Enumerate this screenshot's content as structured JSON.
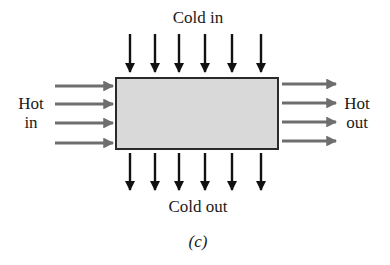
{
  "diagram": {
    "type": "crossflow_heat_exchanger",
    "labels": {
      "cold_in": "Cold in",
      "cold_out": "Cold out",
      "hot_in_line1": "Hot",
      "hot_in_line2": "in",
      "hot_out_line1": "Hot",
      "hot_out_line2": "out",
      "caption": "(c)"
    },
    "colors": {
      "box_fill": "#d9d9d9",
      "box_stroke": "#2a2a2a",
      "cold_arrow": "#111111",
      "hot_arrow": "#6e6e6e"
    },
    "box": {
      "x": 116,
      "y": 78,
      "width": 162,
      "height": 71
    },
    "cold_in_arrows": {
      "count": 6,
      "x": [
        130,
        155,
        179,
        205,
        232,
        261
      ],
      "y_start": 34,
      "y_end": 72
    },
    "cold_out_arrows": {
      "count": 6,
      "x": [
        130,
        155,
        179,
        205,
        232,
        261
      ],
      "y_start": 153,
      "y_end": 190
    },
    "hot_in_arrows": {
      "count": 4,
      "y": [
        86,
        104,
        123,
        143
      ],
      "x_start": 55,
      "x_end": 113
    },
    "hot_out_arrows": {
      "count": 4,
      "y": [
        84,
        103,
        122,
        141
      ],
      "x_start": 282,
      "x_end": 336
    }
  }
}
